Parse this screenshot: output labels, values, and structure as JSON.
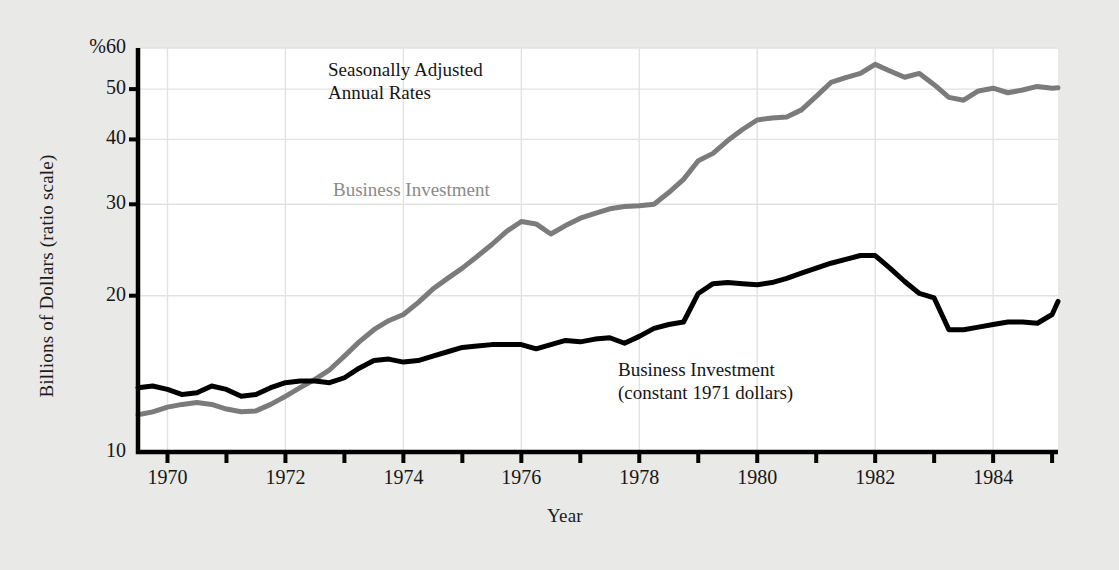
{
  "figure": {
    "background_color": "#e9e9e7",
    "plot_background_color": "#ffffff",
    "axis_color": "#000000",
    "grid_color": "#e2e2e2"
  },
  "axes": {
    "ylabel": "Billions of Dollars (ratio scale)",
    "xlabel": "Year",
    "y_ticks": [
      {
        "value": 60,
        "label": "%60"
      },
      {
        "value": 50,
        "label": "50"
      },
      {
        "value": 40,
        "label": "40"
      },
      {
        "value": 30,
        "label": "30"
      },
      {
        "value": 20,
        "label": "20"
      },
      {
        "value": 10,
        "label": "10"
      }
    ],
    "x_ticks": [
      {
        "value": 1970,
        "label": "1970"
      },
      {
        "value": 1971,
        "label": ""
      },
      {
        "value": 1972,
        "label": "1972"
      },
      {
        "value": 1973,
        "label": ""
      },
      {
        "value": 1974,
        "label": "1974"
      },
      {
        "value": 1975,
        "label": ""
      },
      {
        "value": 1976,
        "label": "1976"
      },
      {
        "value": 1977,
        "label": ""
      },
      {
        "value": 1978,
        "label": "1978"
      },
      {
        "value": 1979,
        "label": ""
      },
      {
        "value": 1980,
        "label": "1980"
      },
      {
        "value": 1981,
        "label": ""
      },
      {
        "value": 1982,
        "label": "1982"
      },
      {
        "value": 1983,
        "label": ""
      },
      {
        "value": 1984,
        "label": "1984"
      },
      {
        "value": 1985,
        "label": ""
      }
    ]
  },
  "annotations": [
    {
      "name": "seasonally-adjusted-note",
      "text": "Seasonally Adjusted\nAnnual Rates",
      "color": "#151515",
      "x": 328,
      "y": 58
    },
    {
      "name": "business-investment-nominal-label",
      "text": "Business Investment",
      "color": "#8a8a8a",
      "x": 333,
      "y": 178
    },
    {
      "name": "business-investment-constant-label",
      "text": "Business Investment\n(constant 1971 dollars)",
      "color": "#151515",
      "x": 618,
      "y": 358
    }
  ],
  "chart_data": {
    "type": "line",
    "title": "",
    "xlabel": "Year",
    "ylabel": "Billions of Dollars (ratio scale)",
    "yscale": "log",
    "ylim": [
      10,
      60
    ],
    "xlim": [
      1969.5,
      1985.1
    ],
    "grid": true,
    "legend": "inline-annotations",
    "ytick_labels": [
      "%60",
      "50",
      "40",
      "30",
      "20",
      "10"
    ],
    "xtick_labels": [
      "1970",
      "1972",
      "1974",
      "1976",
      "1978",
      "1980",
      "1982",
      "1984"
    ],
    "series": [
      {
        "name": "Business Investment",
        "color": "#7b7b7b",
        "linewidth": 5,
        "points": [
          [
            1969.5,
            11.8
          ],
          [
            1969.75,
            11.95
          ],
          [
            1970.0,
            12.2
          ],
          [
            1970.25,
            12.35
          ],
          [
            1970.5,
            12.45
          ],
          [
            1970.75,
            12.35
          ],
          [
            1971.0,
            12.1
          ],
          [
            1971.25,
            11.95
          ],
          [
            1971.5,
            12.0
          ],
          [
            1971.75,
            12.35
          ],
          [
            1972.0,
            12.8
          ],
          [
            1972.25,
            13.3
          ],
          [
            1972.5,
            13.8
          ],
          [
            1972.75,
            14.4
          ],
          [
            1973.0,
            15.3
          ],
          [
            1973.25,
            16.3
          ],
          [
            1973.5,
            17.2
          ],
          [
            1973.75,
            17.9
          ],
          [
            1974.0,
            18.4
          ],
          [
            1974.25,
            19.4
          ],
          [
            1974.5,
            20.6
          ],
          [
            1974.75,
            21.6
          ],
          [
            1975.0,
            22.6
          ],
          [
            1975.25,
            23.8
          ],
          [
            1975.5,
            25.1
          ],
          [
            1975.75,
            26.6
          ],
          [
            1976.0,
            27.8
          ],
          [
            1976.25,
            27.5
          ],
          [
            1976.5,
            26.3
          ],
          [
            1976.75,
            27.3
          ],
          [
            1977.0,
            28.2
          ],
          [
            1977.25,
            28.8
          ],
          [
            1977.5,
            29.4
          ],
          [
            1977.75,
            29.7
          ],
          [
            1978.0,
            29.8
          ],
          [
            1978.25,
            30.0
          ],
          [
            1978.5,
            31.6
          ],
          [
            1978.75,
            33.5
          ],
          [
            1979.0,
            36.4
          ],
          [
            1979.25,
            37.6
          ],
          [
            1979.5,
            39.8
          ],
          [
            1979.75,
            41.8
          ],
          [
            1980.0,
            43.6
          ],
          [
            1980.25,
            44.0
          ],
          [
            1980.5,
            44.2
          ],
          [
            1980.75,
            45.6
          ],
          [
            1981.0,
            48.4
          ],
          [
            1981.25,
            51.5
          ],
          [
            1981.5,
            52.6
          ],
          [
            1981.75,
            53.6
          ],
          [
            1982.0,
            55.8
          ],
          [
            1982.25,
            54.2
          ],
          [
            1982.5,
            52.7
          ],
          [
            1982.75,
            53.6
          ],
          [
            1983.0,
            51.0
          ],
          [
            1983.25,
            48.2
          ],
          [
            1983.5,
            47.6
          ],
          [
            1983.75,
            49.6
          ],
          [
            1984.0,
            50.2
          ],
          [
            1984.25,
            49.2
          ],
          [
            1984.5,
            49.8
          ],
          [
            1984.75,
            50.6
          ],
          [
            1985.0,
            50.2
          ],
          [
            1985.1,
            50.3
          ]
        ]
      },
      {
        "name": "Business Investment (constant 1971 dollars)",
        "color": "#000000",
        "linewidth": 5,
        "points": [
          [
            1969.5,
            13.3
          ],
          [
            1969.75,
            13.4
          ],
          [
            1970.0,
            13.2
          ],
          [
            1970.25,
            12.9
          ],
          [
            1970.5,
            13.0
          ],
          [
            1970.75,
            13.4
          ],
          [
            1971.0,
            13.2
          ],
          [
            1971.25,
            12.8
          ],
          [
            1971.5,
            12.9
          ],
          [
            1971.75,
            13.3
          ],
          [
            1972.0,
            13.6
          ],
          [
            1972.25,
            13.7
          ],
          [
            1972.5,
            13.7
          ],
          [
            1972.75,
            13.6
          ],
          [
            1973.0,
            13.9
          ],
          [
            1973.25,
            14.5
          ],
          [
            1973.5,
            15.0
          ],
          [
            1973.75,
            15.1
          ],
          [
            1974.0,
            14.9
          ],
          [
            1974.25,
            15.0
          ],
          [
            1974.5,
            15.3
          ],
          [
            1974.75,
            15.6
          ],
          [
            1975.0,
            15.9
          ],
          [
            1975.25,
            16.0
          ],
          [
            1975.5,
            16.1
          ],
          [
            1975.75,
            16.1
          ],
          [
            1976.0,
            16.1
          ],
          [
            1976.25,
            15.8
          ],
          [
            1976.5,
            16.1
          ],
          [
            1976.75,
            16.4
          ],
          [
            1977.0,
            16.3
          ],
          [
            1977.25,
            16.5
          ],
          [
            1977.5,
            16.6
          ],
          [
            1977.75,
            16.2
          ],
          [
            1978.0,
            16.7
          ],
          [
            1978.25,
            17.3
          ],
          [
            1978.5,
            17.6
          ],
          [
            1978.75,
            17.8
          ],
          [
            1979.0,
            20.2
          ],
          [
            1979.25,
            21.1
          ],
          [
            1979.5,
            21.2
          ],
          [
            1979.75,
            21.1
          ],
          [
            1980.0,
            21.0
          ],
          [
            1980.25,
            21.2
          ],
          [
            1980.5,
            21.6
          ],
          [
            1980.75,
            22.1
          ],
          [
            1981.0,
            22.6
          ],
          [
            1981.25,
            23.1
          ],
          [
            1981.5,
            23.5
          ],
          [
            1981.75,
            23.9
          ],
          [
            1982.0,
            23.9
          ],
          [
            1982.25,
            22.6
          ],
          [
            1982.5,
            21.3
          ],
          [
            1982.75,
            20.2
          ],
          [
            1983.0,
            19.8
          ],
          [
            1983.25,
            17.2
          ],
          [
            1983.5,
            17.2
          ],
          [
            1983.75,
            17.4
          ],
          [
            1984.0,
            17.6
          ],
          [
            1984.25,
            17.8
          ],
          [
            1984.5,
            17.8
          ],
          [
            1984.75,
            17.7
          ],
          [
            1985.0,
            18.4
          ],
          [
            1985.1,
            19.5
          ]
        ]
      }
    ]
  }
}
